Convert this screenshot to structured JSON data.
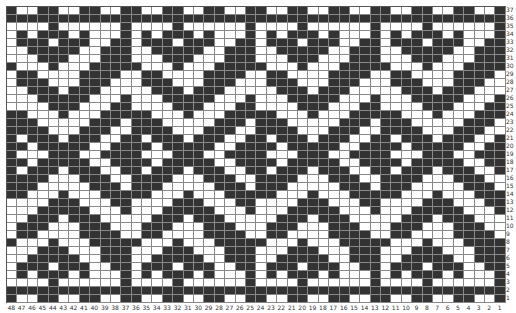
{
  "chart": {
    "type": "knitting-colorwork-chart",
    "columns": 48,
    "rows": 37,
    "colors": {
      "filled": "#333333",
      "empty": "#ffffff",
      "grid": "#888888"
    },
    "column_labels": [
      "48",
      "47",
      "46",
      "45",
      "44",
      "43",
      "42",
      "41",
      "40",
      "39",
      "38",
      "37",
      "36",
      "35",
      "34",
      "33",
      "32",
      "31",
      "30",
      "29",
      "28",
      "27",
      "26",
      "25",
      "24",
      "23",
      "22",
      "21",
      "20",
      "19",
      "18",
      "17",
      "16",
      "15",
      "14",
      "13",
      "12",
      "11",
      "10",
      "9",
      "8",
      "7",
      "6",
      "5",
      "4",
      "3",
      "2",
      "1"
    ],
    "row_labels": [
      "37",
      "36",
      "35",
      "34",
      "33",
      "32",
      "31",
      "30",
      "29",
      "28",
      "27",
      "26",
      "25",
      "24",
      "23",
      "22",
      "21",
      "20",
      "19",
      "18",
      "17",
      "16",
      "15",
      "14",
      "13",
      "12",
      "11",
      "10",
      "9",
      "8",
      "7",
      "6",
      "5",
      "4",
      "3",
      "2",
      "1"
    ],
    "grid_rows": [
      "100110011001100110011001100110011001100110011001",
      "111111111111111111111111111111111111111111111111",
      "000010000001000010000001000010000001000010000001",
      "010111010001010111010001010111010001010111010001",
      "011101110011011101110011011101110011011101110011",
      "001111100111001111100111001111100111001111100111",
      "000111000111000111000111000111000111000111000111",
      "100010001111100010001111100010001111100010001111",
      "011000011110011000011110011000011110011000011110",
      "011100011100011100011100011100011100011100011100",
      "001110111000001110111000001110111000001110111000",
      "000111110001000111110001000111110001000111110001",
      "000011100011000011100011000011100011000011100011",
      "110001000111110001000111110001000111110001000111",
      "111000001110111000001110111000001110111000001110",
      "111100011100111100011100111100011100111100011100",
      "101110111001101110111001101110111001101110111001",
      "110111110011110111110011110111110011110111110011",
      "100011100111100011100111100011100111100011100111",
      "110111110011110111110011110111110011110111110011",
      "101110111001101110111001101110111001101110111001",
      "111100011100111100011100111100011100111100011100",
      "111000001110111000001110111000001110111000001110",
      "110001000111110001000111110001000111110001000111",
      "000011100011000011100011000011100011000011100011",
      "000111110001000111110001000111110001000111110001",
      "001110111000001110111000001110111000001110111000",
      "011100011100011100011100011100011100011100011100",
      "011000011110011000011110011000011110011000011110",
      "100010001111100010001111100010001111100010001111",
      "000111000111000111000111000111000111000111000111",
      "001111100111001111100111001111100111001111100111",
      "011101110011011101110011011101110011011101110011",
      "010111010001010111010001010111010001010111010001",
      "000010000001000010000001000010000001000010000001",
      "111111111111111111111111111111111111111111111111",
      "100110011001100110011001100110011001100110011001"
    ]
  }
}
